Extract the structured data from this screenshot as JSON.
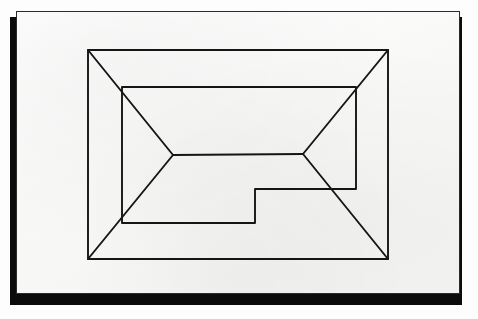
{
  "scene": {
    "kind": "photograph-of-hand-drawing",
    "background_color": "#fdfdfd",
    "canvas_width": 478,
    "canvas_height": 319
  },
  "paper": {
    "label": "sheet of white paper",
    "fill_color": "#fbfbfa",
    "edge_color": "#2b2b2b",
    "shadow_color": "#0b0b0b",
    "x": 16,
    "y": 11,
    "width": 444,
    "height": 283
  },
  "drawing": {
    "title": "nested rectangle perspective line drawing with notched step",
    "ink_color": "#151515",
    "stroke_width": 1.9,
    "outer_rectangle": {
      "label": "outer rectangle",
      "left": 88,
      "top": 50,
      "right": 388,
      "bottom": 259
    },
    "inner_shape": {
      "label": "inner notched polygon",
      "points": "122,87 356,87 356,189 255,189 255,223 122,223"
    },
    "diagonals": [
      {
        "label": "diagonal-top-left",
        "x1": 88,
        "y1": 50,
        "x2": 173,
        "y2": 155
      },
      {
        "label": "diagonal-bottom-left",
        "x1": 88,
        "y1": 259,
        "x2": 173,
        "y2": 155
      },
      {
        "label": "diagonal-top-right",
        "x1": 388,
        "y1": 50,
        "x2": 303,
        "y2": 154
      },
      {
        "label": "diagonal-bottom-right",
        "x1": 388,
        "y1": 259,
        "x2": 303,
        "y2": 154
      }
    ],
    "spine": {
      "label": "central horizontal spine",
      "x1": 173,
      "y1": 155,
      "x2": 303,
      "y2": 154
    },
    "vertices": {
      "left_apex": {
        "x": 173,
        "y": 155
      },
      "right_apex": {
        "x": 303,
        "y": 154
      }
    }
  }
}
